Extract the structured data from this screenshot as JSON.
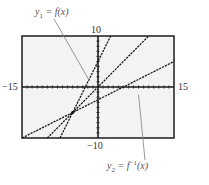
{
  "chart_data": {
    "type": "line",
    "title": "",
    "xlabel": "",
    "ylabel": "",
    "xlim": [
      -15,
      15
    ],
    "ylim": [
      -10,
      10
    ],
    "grid": false,
    "tick_labels": {
      "xmin": "−15",
      "xmax": "15",
      "ymax": "10",
      "ymin": "−10"
    },
    "series": [
      {
        "name": "y1 = f(x)",
        "equation": "y = 2x + 5",
        "style": "dashed",
        "points": [
          [
            -7.5,
            -10
          ],
          [
            2.5,
            10
          ]
        ]
      },
      {
        "name": "y = x",
        "equation": "y = x",
        "style": "dashed",
        "points": [
          [
            -10,
            -10
          ],
          [
            10,
            10
          ]
        ]
      },
      {
        "name": "y2 = f^-1(x)",
        "equation": "y = (x - 5)/2",
        "style": "dashed",
        "points": [
          [
            -15,
            -10
          ],
          [
            15,
            5
          ]
        ]
      }
    ],
    "annotations": [
      {
        "text": "y1 = f(x)",
        "points_to": [
          -1.8,
          1.4
        ]
      },
      {
        "text": "y2 = f^-1(x)",
        "points_to": [
          8,
          -1.5
        ]
      },
      {
        "text": "intersection",
        "point": [
          -5,
          -5
        ]
      }
    ]
  },
  "labels": {
    "xmin": "−15",
    "xmax": "15",
    "ymax": "10",
    "ymin": "−10",
    "y1_label": "y",
    "y1_sub": "1",
    "y1_rest": " = f(x)",
    "y2_label": "y",
    "y2_sub": "2",
    "y2_rest": " = f",
    "y2_sup": "−1",
    "y2_tail": "(x)"
  },
  "colors": {
    "frame": "#2a2a2a",
    "plot_bg": "#f3f3f3",
    "line": "#1a1a1a",
    "pointer": "#8c8c8c"
  }
}
